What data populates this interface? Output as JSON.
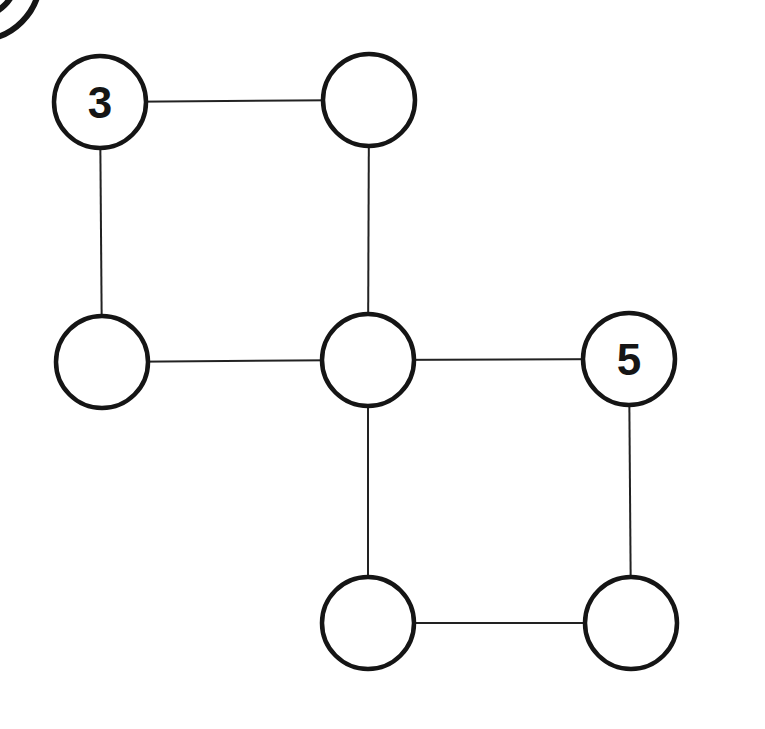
{
  "diagram": {
    "type": "graph-puzzle",
    "nodes": [
      {
        "id": "n1",
        "label": "3",
        "cx": 100,
        "cy": 102
      },
      {
        "id": "n2",
        "label": "",
        "cx": 369,
        "cy": 100
      },
      {
        "id": "n3",
        "label": "",
        "cx": 102,
        "cy": 362
      },
      {
        "id": "n4",
        "label": "",
        "cx": 368,
        "cy": 360
      },
      {
        "id": "n5",
        "label": "5",
        "cx": 629,
        "cy": 359
      },
      {
        "id": "n6",
        "label": "",
        "cx": 368,
        "cy": 623
      },
      {
        "id": "n7",
        "label": "",
        "cx": 631,
        "cy": 623
      }
    ],
    "edges": [
      [
        "n1",
        "n2"
      ],
      [
        "n1",
        "n3"
      ],
      [
        "n2",
        "n4"
      ],
      [
        "n3",
        "n4"
      ],
      [
        "n4",
        "n5"
      ],
      [
        "n4",
        "n6"
      ],
      [
        "n5",
        "n7"
      ],
      [
        "n6",
        "n7"
      ]
    ],
    "node_radius": 46,
    "colors": {
      "stroke": "#151515",
      "edge": "#222222",
      "background": "#ffffff"
    }
  }
}
